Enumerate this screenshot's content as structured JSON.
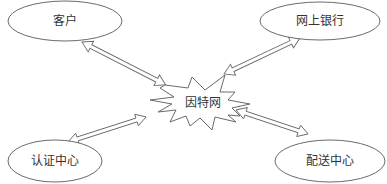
{
  "diagram": {
    "center": {
      "label": "因特网",
      "shape": "explosion-burst"
    },
    "nodes": [
      {
        "id": "customer",
        "label": "客户",
        "shape": "ellipse",
        "position": "top-left"
      },
      {
        "id": "online-bank",
        "label": "网上银行",
        "shape": "ellipse",
        "position": "top-right"
      },
      {
        "id": "certification-center",
        "label": "认证中心",
        "shape": "ellipse",
        "position": "bottom-left"
      },
      {
        "id": "distribution-center",
        "label": "配送中心",
        "shape": "ellipse",
        "position": "bottom-right"
      }
    ],
    "edges": [
      {
        "from": "客户",
        "to": "因特网",
        "type": "bidirectional"
      },
      {
        "from": "网上银行",
        "to": "因特网",
        "type": "bidirectional"
      },
      {
        "from": "认证中心",
        "to": "因特网",
        "type": "bidirectional"
      },
      {
        "from": "配送中心",
        "to": "因特网",
        "type": "bidirectional"
      }
    ],
    "colors": {
      "stroke": "#6a6a6a",
      "text": "#333333",
      "background": "#ffffff"
    }
  }
}
